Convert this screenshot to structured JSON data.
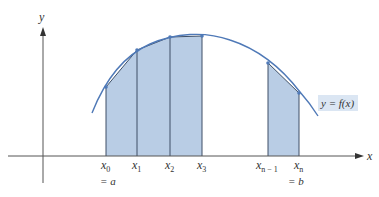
{
  "diagram": {
    "axes": {
      "x_label": "x",
      "y_label": "y"
    },
    "curve_label": {
      "text": "y = f(x)",
      "background": "#dbe6f3"
    },
    "colors": {
      "fill": "#b9cde5",
      "curve": "#4f79b7",
      "stroke": "#3e4f66",
      "axis": "#555555"
    },
    "partition_points": [
      {
        "label": "x",
        "sub": "0",
        "extra": "= a",
        "px": 106,
        "py": 87
      },
      {
        "label": "x",
        "sub": "1",
        "extra": "",
        "px": 137,
        "py": 50
      },
      {
        "label": "x",
        "sub": "2",
        "extra": "",
        "px": 170,
        "py": 37
      },
      {
        "label": "x",
        "sub": "3",
        "extra": "",
        "px": 202,
        "py": 36
      },
      {
        "label": "x",
        "sub": "n − 1",
        "extra": "",
        "px": 268,
        "py": 63
      },
      {
        "label": "x",
        "sub": "n",
        "extra": "= b",
        "px": 299,
        "py": 93
      }
    ]
  }
}
